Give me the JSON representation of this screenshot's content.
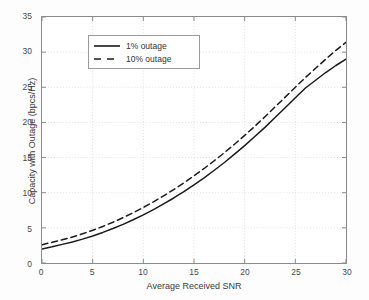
{
  "chart_data": {
    "type": "line",
    "title": "",
    "xlabel": "Average Received SNR",
    "ylabel": "Capacity with Outage (bpcs/Hz)",
    "xlim": [
      0,
      30
    ],
    "ylim": [
      0,
      35
    ],
    "xticks": [
      0,
      5,
      10,
      15,
      20,
      25,
      30
    ],
    "yticks": [
      0,
      5,
      10,
      15,
      20,
      25,
      30,
      35
    ],
    "grid": true,
    "legend_position": "upper left",
    "x": [
      0,
      1,
      2,
      3,
      4,
      5,
      6,
      7,
      8,
      9,
      10,
      11,
      12,
      13,
      14,
      15,
      16,
      17,
      18,
      19,
      20,
      21,
      22,
      23,
      24,
      25,
      26,
      27,
      28,
      29,
      30
    ],
    "series": [
      {
        "name": "1% outage",
        "style": "solid",
        "color": "#1a1a1a",
        "values": [
          2.0,
          2.3,
          2.65,
          3.0,
          3.4,
          3.85,
          4.35,
          4.9,
          5.5,
          6.15,
          6.85,
          7.6,
          8.4,
          9.25,
          10.15,
          11.1,
          12.1,
          13.2,
          14.3,
          15.5,
          16.7,
          18.0,
          19.3,
          20.7,
          22.1,
          23.5,
          24.9,
          26.0,
          27.1,
          28.1,
          29.0
        ]
      },
      {
        "name": "10% outage",
        "style": "dashed",
        "color": "#1a1a1a",
        "values": [
          2.6,
          2.95,
          3.3,
          3.7,
          4.15,
          4.65,
          5.2,
          5.8,
          6.45,
          7.15,
          7.9,
          8.7,
          9.55,
          10.45,
          11.4,
          12.4,
          13.45,
          14.55,
          15.7,
          16.9,
          18.15,
          19.45,
          20.8,
          22.2,
          23.6,
          25.0,
          26.4,
          27.7,
          29.0,
          30.25,
          31.4
        ]
      }
    ]
  },
  "legend": {
    "entries": [
      {
        "label": "1% outage"
      },
      {
        "label": "10% outage"
      }
    ]
  },
  "colors": {
    "line": "#1a1a1a",
    "axis": "#8a8a8a",
    "grid": "#d8d8d8",
    "text": "#3a3a3a",
    "background": "#ffffff"
  }
}
